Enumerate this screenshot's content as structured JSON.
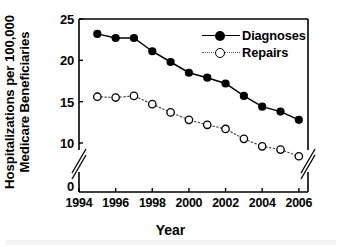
{
  "chart_data": {
    "type": "line",
    "title": "",
    "xlabel": "Year",
    "ylabel_lines": [
      "Hospitalizations per 100,000",
      "Medicare Beneficiaries"
    ],
    "ylabel": "Hospitalizations per 100,000 Medicare Beneficiaries",
    "x": [
      1995,
      1996,
      1997,
      1998,
      1999,
      2000,
      2001,
      2002,
      2003,
      2004,
      2005,
      2006
    ],
    "series": [
      {
        "name": "Diagnoses",
        "marker": "filled-circle",
        "line": "solid",
        "color": "#000000",
        "values": [
          23.2,
          22.7,
          22.7,
          21.1,
          19.8,
          18.5,
          17.9,
          17.2,
          15.7,
          14.4,
          13.8,
          12.8
        ]
      },
      {
        "name": "Repairs",
        "marker": "open-circle",
        "line": "dotted",
        "color": "#000000",
        "values": [
          15.6,
          15.5,
          15.7,
          14.7,
          13.7,
          12.8,
          12.2,
          11.7,
          10.5,
          9.6,
          9.2,
          8.4
        ]
      }
    ],
    "xlim": [
      1994,
      2006.5
    ],
    "ylim": [
      0,
      25
    ],
    "xticks": [
      1994,
      1996,
      1998,
      2000,
      2002,
      2004,
      2006
    ],
    "xtick_labels": [
      "1994",
      "1996",
      "1998",
      "2000",
      "2002",
      "2004",
      "2006"
    ],
    "yticks": [
      0,
      10,
      15,
      20,
      25
    ],
    "ytick_labels": [
      "0",
      "10",
      "15",
      "20",
      "25"
    ],
    "y_axis_break": {
      "present": true,
      "between": [
        0,
        10
      ],
      "symbol": "double-slash"
    },
    "grid": false,
    "legend_position": "top-right",
    "legend": [
      "Diagnoses",
      "Repairs"
    ]
  },
  "axis": {
    "ylabel_line1": "Hospitalizations per 100,000",
    "ylabel_line2": "Medicare Beneficiaries",
    "xlabel": "Year"
  },
  "legend": {
    "entry_0_label": "Diagnoses",
    "entry_1_label": "Repairs"
  }
}
